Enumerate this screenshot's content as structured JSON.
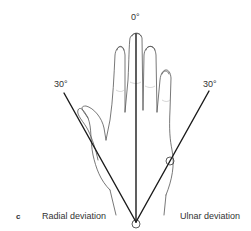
{
  "figure": {
    "panel_label": "c",
    "angles": {
      "center": "0°",
      "left": "30°",
      "right": "30°"
    },
    "captions": {
      "left": "Radial deviation",
      "right": "Ulnar deviation"
    },
    "colors": {
      "line": "#1a1a1a",
      "outline": "#555555",
      "text": "#333333"
    }
  }
}
